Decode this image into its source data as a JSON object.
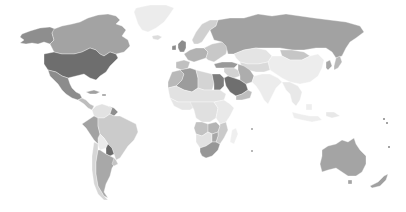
{
  "map": {
    "type": "choropleth",
    "projection": "equirectangular-like (Robinson-style world)",
    "background": "#ffffff",
    "scale": {
      "darkest": "#6a6a6a",
      "dark": "#8a8a8a",
      "medium": "#a6a6a6",
      "light": "#c8c8c8",
      "lighter": "#dcdcdc",
      "lightest": "#ececec",
      "nodata": "#f4f4f4"
    },
    "regions": [
      {
        "id": "alaska",
        "name": "Alaska (USA)",
        "shade": "#8e8e8e"
      },
      {
        "id": "canada",
        "name": "Canada",
        "shade": "#a3a3a3"
      },
      {
        "id": "greenland",
        "name": "Greenland",
        "shade": "#ececec"
      },
      {
        "id": "usa",
        "name": "United States",
        "shade": "#6e6e6e"
      },
      {
        "id": "mexico",
        "name": "Mexico",
        "shade": "#8c8c8c"
      },
      {
        "id": "central-america",
        "name": "Central America",
        "shade": "#bdbdbd"
      },
      {
        "id": "caribbean",
        "name": "Caribbean",
        "shade": "#a0a0a0"
      },
      {
        "id": "colombia-venezuela",
        "name": "Colombia / Venezuela",
        "shade": "#e2e2e2"
      },
      {
        "id": "guianas",
        "name": "Guyana / Suriname",
        "shade": "#8f8f8f"
      },
      {
        "id": "peru-ecuador",
        "name": "Peru / Ecuador",
        "shade": "#a2a2a2"
      },
      {
        "id": "brazil",
        "name": "Brazil",
        "shade": "#cbcbcb"
      },
      {
        "id": "bolivia",
        "name": "Bolivia",
        "shade": "#ebebeb"
      },
      {
        "id": "paraguay",
        "name": "Paraguay",
        "shade": "#6b6b6b"
      },
      {
        "id": "chile",
        "name": "Chile",
        "shade": "#d6d6d6"
      },
      {
        "id": "argentina",
        "name": "Argentina",
        "shade": "#a8a8a8"
      },
      {
        "id": "uruguay",
        "name": "Uruguay",
        "shade": "#c4c4c4"
      },
      {
        "id": "iceland",
        "name": "Iceland",
        "shade": "#dcdcdc"
      },
      {
        "id": "uk-ireland",
        "name": "UK / Ireland",
        "shade": "#8c8c8c"
      },
      {
        "id": "scandinavia",
        "name": "Scandinavia",
        "shade": "#d0d0d0"
      },
      {
        "id": "western-europe",
        "name": "Western Europe",
        "shade": "#b2b2b2"
      },
      {
        "id": "iberia",
        "name": "Spain / Portugal",
        "shade": "#c0c0c0"
      },
      {
        "id": "eastern-europe",
        "name": "Eastern Europe",
        "shade": "#c8c8c8"
      },
      {
        "id": "russia",
        "name": "Russia",
        "shade": "#a2a2a2"
      },
      {
        "id": "kazakhstan",
        "name": "Kazakhstan",
        "shade": "#e4e4e4"
      },
      {
        "id": "mongolia",
        "name": "Mongolia",
        "shade": "#c6c6c6"
      },
      {
        "id": "china",
        "name": "China",
        "shade": "#ededed"
      },
      {
        "id": "central-asia",
        "name": "Central Asia",
        "shade": "#dadada"
      },
      {
        "id": "turkey",
        "name": "Turkey",
        "shade": "#9a9a9a"
      },
      {
        "id": "iran",
        "name": "Iran",
        "shade": "#adadad"
      },
      {
        "id": "iraq-syria",
        "name": "Iraq / Syria",
        "shade": "#d2d2d2"
      },
      {
        "id": "saudi-arabia",
        "name": "Saudi Arabia",
        "shade": "#6f6f6f"
      },
      {
        "id": "yemen-oman",
        "name": "Yemen / Oman",
        "shade": "#bdbdbd"
      },
      {
        "id": "india",
        "name": "India / South Asia",
        "shade": "#ececec"
      },
      {
        "id": "southeast-asia",
        "name": "Southeast Asia",
        "shade": "#e8e8e8"
      },
      {
        "id": "indonesia",
        "name": "Indonesia",
        "shade": "#eeeeee"
      },
      {
        "id": "japan",
        "name": "Japan",
        "shade": "#b8b8b8"
      },
      {
        "id": "korea",
        "name": "Korea",
        "shade": "#a8a8a8"
      },
      {
        "id": "morocco-w-sahara",
        "name": "Morocco / W. Sahara",
        "shade": "#b9b9b9"
      },
      {
        "id": "algeria",
        "name": "Algeria",
        "shade": "#9c9c9c"
      },
      {
        "id": "libya",
        "name": "Libya",
        "shade": "#d4d4d4"
      },
      {
        "id": "egypt",
        "name": "Egypt",
        "shade": "#7d7d7d"
      },
      {
        "id": "sahel",
        "name": "Sahel",
        "shade": "#e2e2e2"
      },
      {
        "id": "west-africa",
        "name": "West Africa",
        "shade": "#e6e6e6"
      },
      {
        "id": "central-africa",
        "name": "Central Africa",
        "shade": "#e0e0e0"
      },
      {
        "id": "east-africa",
        "name": "East Africa",
        "shade": "#e9e9e9"
      },
      {
        "id": "angola",
        "name": "Angola",
        "shade": "#c2c2c2"
      },
      {
        "id": "zambia",
        "name": "Zambia",
        "shade": "#b4b4b4"
      },
      {
        "id": "mozambique",
        "name": "Mozambique",
        "shade": "#cacaca"
      },
      {
        "id": "namibia-botswana",
        "name": "Namibia / Botswana",
        "shade": "#e2e2e2"
      },
      {
        "id": "zimbabwe",
        "name": "Zimbabwe",
        "shade": "#a8a8a8"
      },
      {
        "id": "south-africa",
        "name": "South Africa",
        "shade": "#979797"
      },
      {
        "id": "madagascar",
        "name": "Madagascar",
        "shade": "#efefef"
      },
      {
        "id": "australia",
        "name": "Australia",
        "shade": "#a4a4a4"
      },
      {
        "id": "new-zealand",
        "name": "New Zealand",
        "shade": "#a0a0a0"
      },
      {
        "id": "papua",
        "name": "Papua New Guinea",
        "shade": "#e8e8e8"
      },
      {
        "id": "pacific-islands",
        "name": "Pacific Islands",
        "shade": "#7a7a7a"
      },
      {
        "id": "indian-ocean-islands",
        "name": "Indian Ocean Islands",
        "shade": "#999999"
      }
    ]
  }
}
